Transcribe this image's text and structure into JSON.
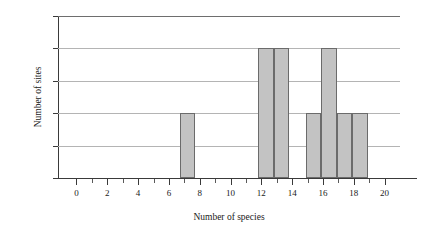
{
  "chart_data": {
    "type": "bar",
    "title": "",
    "subtitle": "",
    "xlabel": "Number of species",
    "ylabel": "Number of sites",
    "xlim": [
      -1.2,
      21.0
    ],
    "ylim": [
      0.0,
      2.5
    ],
    "grid": true,
    "legend": null,
    "xticks": [
      0,
      2,
      4,
      6,
      8,
      10,
      12,
      14,
      16,
      18,
      20
    ],
    "xtick_labels": [
      "0",
      "2",
      "4",
      "6",
      "8",
      "10",
      "12",
      "14",
      "16",
      "18",
      "20"
    ],
    "xminor_ticks": [
      1,
      3,
      5,
      7,
      9,
      11,
      13,
      15,
      17,
      19
    ],
    "yticks": [
      0.0,
      0.5,
      1.0,
      1.5,
      2.0,
      2.5
    ],
    "ytick_labels": [
      "0.0",
      "0.5",
      "1.0",
      "1.5",
      "2.0",
      "2.5"
    ],
    "bar_fill_color": "#c3c3c3",
    "bar_edge_color": "#6b6b6b",
    "gridline_color": "#b4b4b4",
    "axis_color": "#3a3a3a",
    "bins": [
      {
        "x0": 6.7,
        "x1": 7.7,
        "value": 1.0
      },
      {
        "x0": 11.8,
        "x1": 12.8,
        "value": 2.0
      },
      {
        "x0": 12.8,
        "x1": 13.8,
        "value": 2.0
      },
      {
        "x0": 14.9,
        "x1": 15.9,
        "value": 1.0
      },
      {
        "x0": 15.9,
        "x1": 16.9,
        "value": 2.0
      },
      {
        "x0": 16.9,
        "x1": 17.9,
        "value": 1.0
      },
      {
        "x0": 17.9,
        "x1": 18.9,
        "value": 1.0
      }
    ],
    "categories": [
      "7",
      "12",
      "13",
      "15",
      "16",
      "17",
      "18"
    ],
    "values": [
      1,
      2,
      2,
      1,
      2,
      1,
      1
    ]
  }
}
